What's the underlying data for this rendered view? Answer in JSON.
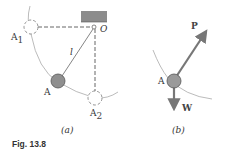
{
  "figure": {
    "caption": "Fig. 13.8",
    "colors": {
      "support": "#8c8c8c",
      "ball_fill": "#8f8f8f",
      "arrow": "#777777",
      "line": "#777777",
      "dashed": "#666666"
    },
    "panel_a": {
      "label": "(a)",
      "pivot_label": "O",
      "length_label": "l",
      "positions": [
        {
          "name": "A",
          "label": "A",
          "sub": "",
          "style": "filled"
        },
        {
          "name": "A1",
          "label": "A",
          "sub": "1",
          "style": "dashed"
        },
        {
          "name": "A2",
          "label": "A",
          "sub": "2",
          "style": "dashed"
        }
      ]
    },
    "panel_b": {
      "label": "(b)",
      "point_label": "A",
      "forces": [
        {
          "name": "P",
          "label": "P",
          "direction": "up-right"
        },
        {
          "name": "W",
          "label": "W",
          "direction": "down"
        }
      ]
    }
  }
}
